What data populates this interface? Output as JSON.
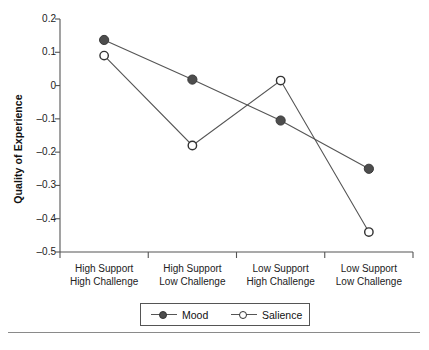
{
  "chart_data": {
    "type": "line",
    "title": "",
    "xlabel": "",
    "ylabel": "Quality of Experience",
    "ylim": [
      -0.5,
      0.2
    ],
    "ytick_labels": [
      "0.2",
      "0.1",
      "0",
      "-0.1",
      "-0.2",
      "-0.3",
      "-0.4",
      "-0.5"
    ],
    "ytick_values": [
      0.2,
      0.1,
      0,
      -0.1,
      -0.2,
      -0.3,
      -0.4,
      -0.5
    ],
    "grid": false,
    "legend_position": "bottom-center",
    "categories": [
      {
        "line1": "High Support",
        "line2": "High Challenge"
      },
      {
        "line1": "High Support",
        "line2": "Low Challenge"
      },
      {
        "line1": "Low Support",
        "line2": "High Challenge"
      },
      {
        "line1": "Low Support",
        "line2": "Low Challenge"
      }
    ],
    "series": [
      {
        "name": "Mood",
        "marker": "filled-circle",
        "color": "#4d4d4d",
        "values": [
          0.137,
          0.018,
          -0.105,
          -0.25
        ]
      },
      {
        "name": "Salience",
        "marker": "open-circle",
        "color": "#ffffff",
        "values": [
          0.09,
          -0.18,
          0.015,
          -0.44
        ]
      }
    ]
  },
  "legend": {
    "entries": [
      {
        "label": "Mood"
      },
      {
        "label": "Salience"
      }
    ]
  },
  "axis": {
    "line_color": "#555555"
  }
}
